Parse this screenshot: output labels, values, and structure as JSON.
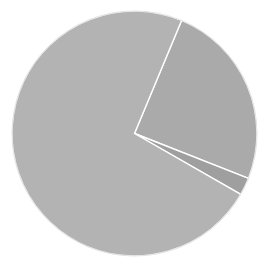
{
  "chart_data": {
    "type": "pie",
    "title": "",
    "labels": [
      "",
      "",
      ""
    ],
    "values": [
      73.0,
      24.7,
      2.3
    ],
    "start_angle_deg": 22.6,
    "direction": "clockwise",
    "colors": [
      "#aaaaaa",
      "#9f9f9f",
      "#b3b3b3"
    ],
    "slice_order_note": "slices listed clockwise starting from the upper-right boundary: medium, small, large",
    "legend": null,
    "edge_color": "#ffffff"
  },
  "slices": [
    {
      "name": "medium",
      "value": 24.7,
      "color": "#aaaaaa"
    },
    {
      "name": "small",
      "value": 2.3,
      "color": "#9f9f9f"
    },
    {
      "name": "large",
      "value": 73.0,
      "color": "#b3b3b3"
    }
  ],
  "geometry": {
    "cx": 134.5,
    "cy": 133.5,
    "r": 122.5,
    "start_angle_deg": 22.6
  }
}
